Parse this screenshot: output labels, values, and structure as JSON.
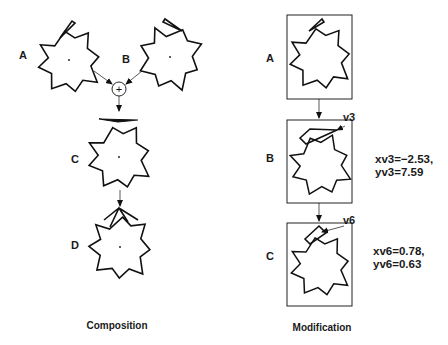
{
  "composition": {
    "caption": "Composition",
    "shapes": [
      {
        "label": "A"
      },
      {
        "label": "B"
      },
      {
        "label": "C"
      },
      {
        "label": "D"
      }
    ],
    "operator_symbol": "+"
  },
  "modification": {
    "caption": "Modification",
    "panels": [
      {
        "label": "A"
      },
      {
        "label": "B",
        "vertex": "v3",
        "values": [
          "xv3=−2.53,",
          "yv3=7.59"
        ]
      },
      {
        "label": "C",
        "vertex": "v6",
        "values": [
          "xv6=0.78,",
          "yv6=0.63"
        ]
      }
    ]
  },
  "colors": {
    "stroke": "#111111",
    "background": "#ffffff"
  }
}
